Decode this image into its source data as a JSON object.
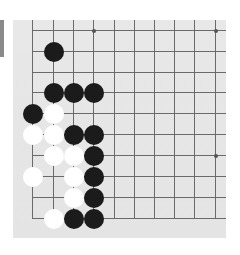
{
  "board": {
    "description": "Bottom-left corner of a Go board (10x10 lines visible)",
    "columns_x": [
      32,
      53,
      73,
      93,
      114,
      134,
      154,
      174,
      194,
      215
    ],
    "rows_y": [
      30,
      51,
      72,
      92,
      113,
      134,
      155,
      176,
      197,
      218
    ],
    "edges": {
      "left": true,
      "bottom": true,
      "top": false,
      "right": false
    },
    "colors": {
      "background": "#e6e6e6",
      "line": "#6a6a6a",
      "black_stone": "#1b1b1b",
      "white_stone": "#ffffff",
      "side_bar": "#8a8a8a"
    },
    "star_points": [
      {
        "col": 3,
        "row": 0
      },
      {
        "col": 9,
        "row": 0
      },
      {
        "col": 3,
        "row": 6
      },
      {
        "col": 9,
        "row": 6
      }
    ],
    "stones": [
      {
        "color": "black",
        "col": 1,
        "row": 1
      },
      {
        "color": "black",
        "col": 1,
        "row": 3
      },
      {
        "color": "black",
        "col": 2,
        "row": 3
      },
      {
        "color": "black",
        "col": 3,
        "row": 3
      },
      {
        "color": "black",
        "col": 0,
        "row": 4
      },
      {
        "color": "white",
        "col": 1,
        "row": 4
      },
      {
        "color": "white",
        "col": 0,
        "row": 5
      },
      {
        "color": "white",
        "col": 1,
        "row": 5
      },
      {
        "color": "black",
        "col": 2,
        "row": 5
      },
      {
        "color": "black",
        "col": 3,
        "row": 5
      },
      {
        "color": "white",
        "col": 1,
        "row": 6
      },
      {
        "color": "white",
        "col": 2,
        "row": 6
      },
      {
        "color": "black",
        "col": 3,
        "row": 6
      },
      {
        "color": "white",
        "col": 0,
        "row": 7
      },
      {
        "color": "white",
        "col": 2,
        "row": 7
      },
      {
        "color": "black",
        "col": 3,
        "row": 7
      },
      {
        "color": "white",
        "col": 2,
        "row": 8
      },
      {
        "color": "black",
        "col": 3,
        "row": 8
      },
      {
        "color": "white",
        "col": 1,
        "row": 9
      },
      {
        "color": "black",
        "col": 2,
        "row": 9
      },
      {
        "color": "black",
        "col": 3,
        "row": 9
      }
    ]
  }
}
